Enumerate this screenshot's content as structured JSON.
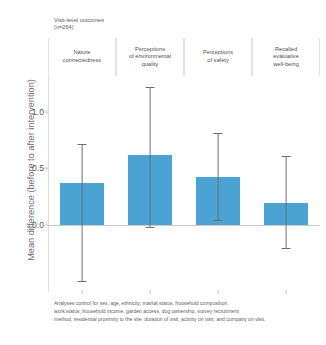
{
  "chart_data": {
    "type": "bar",
    "title_line1": "Visit-level outcomes",
    "title_line2": "(n=264)",
    "xlabel": "",
    "ylabel": "Mean difference (before to after intervention)",
    "categories": [
      "Nature\nconnectedness",
      "Perceptions\nof environmental\nquality",
      "Perceptions\nof safety",
      "Recalled\nevaluative\nwell-being"
    ],
    "values": [
      0.37,
      0.62,
      0.42,
      0.19
    ],
    "error_low": [
      -0.5,
      -0.02,
      0.04,
      -0.21
    ],
    "error_high": [
      0.72,
      1.22,
      0.81,
      0.61
    ],
    "yticks": [
      "0.0",
      "0.5",
      "1.0"
    ],
    "ytick_values": [
      0.0,
      0.5,
      1.0
    ],
    "ylim": [
      -0.6,
      1.32
    ],
    "grid": false,
    "legend": "none",
    "bar_color": "#4ba3d3",
    "error_color": "#6e6f71",
    "axis_color": "#c9cacb",
    "text_color": "#58585a"
  },
  "footnote": {
    "line1": "Analyses control for sex, age, ethnicity, marital status, household composition,",
    "line2": "work status, household income, garden access, dog ownership, survey recruitment",
    "line3": "method, residential proximity to the site, duration of visit, activity on visit, and company on visit."
  }
}
